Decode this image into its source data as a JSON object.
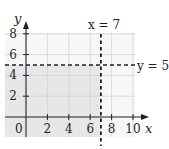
{
  "chart_data": {
    "type": "region",
    "title": "",
    "xlabel": "x",
    "ylabel": "y",
    "xlim": [
      -2,
      10
    ],
    "ylim": [
      -2,
      8
    ],
    "x_ticks": [
      2,
      4,
      6,
      8,
      10
    ],
    "y_ticks": [
      2,
      4,
      6,
      8
    ],
    "origin_label": "0",
    "grid": true,
    "boundary_lines": [
      {
        "equation": "x = 7",
        "orientation": "vertical",
        "value": 7,
        "style": "dashed",
        "label": "x = 7"
      },
      {
        "equation": "y = 5",
        "orientation": "horizontal",
        "value": 5,
        "style": "dashed",
        "label": "y = 5"
      }
    ],
    "shaded_region": {
      "description": "x < 7 and y < 5",
      "x_max": 7,
      "y_max": 5
    }
  },
  "colors": {
    "background": "#ffffff",
    "shade": "#e6e7e8",
    "grid": "#d1d3d4",
    "axis": "#231f20",
    "dashed": "#231f20"
  }
}
